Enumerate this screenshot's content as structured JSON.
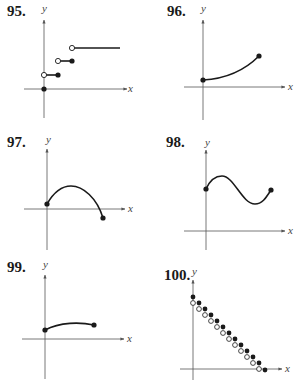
{
  "exercises": [
    {
      "number": "95.",
      "x_label": "x",
      "y_label": "y",
      "description": "Step function: closed dot at origin; steps with open left endpoints and closed right endpoints; final ray continuing right"
    },
    {
      "number": "96.",
      "x_label": "x",
      "y_label": "y",
      "description": "Increasing concave-up curve segment with closed endpoints"
    },
    {
      "number": "97.",
      "x_label": "x",
      "y_label": "y",
      "description": "Arch curve starting above x-axis, rising to a max, descending below x-axis, closed endpoints"
    },
    {
      "number": "98.",
      "x_label": "x",
      "y_label": "y",
      "description": "Wave curve: start, local max, local min, end with closed endpoints"
    },
    {
      "number": "99.",
      "x_label": "x",
      "y_label": "y",
      "description": "Gently rising concave-down curve segment with closed endpoints"
    },
    {
      "number": "100.",
      "x_label": "x",
      "y_label": "y",
      "description": "Descending staircase of paired closed and open dots from y-axis down to x-axis"
    }
  ],
  "colors": {
    "ink": "#1a1a1a",
    "axis": "#555555",
    "background": "#ffffff"
  }
}
